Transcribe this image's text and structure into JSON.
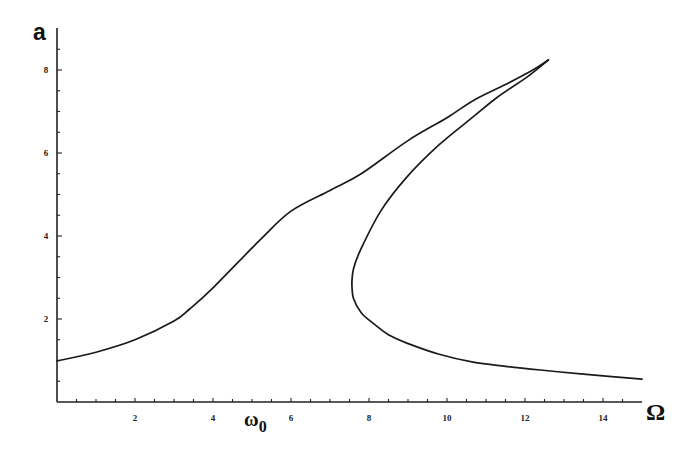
{
  "chart_data": {
    "type": "line",
    "title": "",
    "panel_label": "a",
    "xlabel": "Ω",
    "xlabel_marker": "ω0",
    "ylabel": "a",
    "xlim": [
      0,
      15.2
    ],
    "ylim": [
      0,
      9
    ],
    "grid": false,
    "legend": null,
    "x_ticks": [
      2,
      4,
      6,
      8,
      10,
      12,
      14
    ],
    "y_ticks": [
      2,
      4,
      6,
      8
    ],
    "x_minor_step": 0.5,
    "y_minor_step": 0.5,
    "series": [
      {
        "name": "frequency response (upper / stable branch)",
        "x": [
          0.0,
          1.0,
          2.0,
          3.0,
          3.4,
          4.0,
          5.2,
          6.0,
          7.0,
          7.8,
          9.0,
          10.0,
          10.7,
          11.5,
          12.2,
          12.6
        ],
        "y": [
          0.99,
          1.2,
          1.5,
          1.95,
          2.24,
          2.75,
          3.9,
          4.6,
          5.1,
          5.5,
          6.3,
          6.85,
          7.28,
          7.65,
          8.0,
          8.24
        ]
      },
      {
        "name": "unstable middle branch",
        "x": [
          12.6,
          12.05,
          11.3,
          10.67,
          9.8,
          8.97,
          8.3,
          7.78,
          7.6,
          7.56
        ],
        "y": [
          8.24,
          7.83,
          7.35,
          6.87,
          6.2,
          5.42,
          4.6,
          3.66,
          3.2,
          2.87
        ]
      },
      {
        "name": "lower / stable branch",
        "x": [
          7.56,
          7.6,
          7.8,
          8.1,
          8.5,
          8.97,
          9.8,
          10.67,
          11.5,
          12.4,
          13.5,
          15.0
        ],
        "y": [
          2.87,
          2.5,
          2.15,
          1.9,
          1.62,
          1.42,
          1.15,
          0.96,
          0.86,
          0.77,
          0.67,
          0.55
        ]
      }
    ],
    "annotations": [
      {
        "text": "ω0",
        "x": 5.05,
        "note": "marker below x-axis near Ω≈5"
      }
    ]
  },
  "labels": {
    "panel": "a",
    "x_axis": "Ω",
    "omega0_main": "ω",
    "omega0_sub": "0"
  }
}
